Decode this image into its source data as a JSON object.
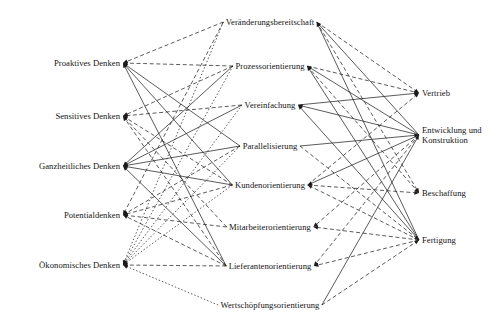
{
  "figure": {
    "type": "tripartite-directed-graph",
    "width": 503,
    "height": 330,
    "background_color": "#ffffff",
    "line_color": "#1a1a1a",
    "text_color": "#141414"
  },
  "columns": {
    "left": {
      "name": "Denkweisen",
      "x": 120,
      "nodes": [
        {
          "id": "L1",
          "label": "Proaktives Denken",
          "y": 63
        },
        {
          "id": "L2",
          "label": "Sensitives Denken",
          "y": 116
        },
        {
          "id": "L3",
          "label": "Ganzheitliches Denken",
          "y": 166
        },
        {
          "id": "L4",
          "label": "Potentialdenken",
          "y": 215
        },
        {
          "id": "L5",
          "label": "Ökonomisches Denken",
          "y": 265
        }
      ]
    },
    "middle": {
      "name": "Gestaltungsprinzipien",
      "x": 270,
      "nodes": [
        {
          "id": "M1",
          "label": "Veränderungsbereitschaft",
          "y": 22
        },
        {
          "id": "M2",
          "label": "Prozessorientierung",
          "y": 66
        },
        {
          "id": "M3",
          "label": "Vereinfachung",
          "y": 105
        },
        {
          "id": "M4",
          "label": "Parallelisierung",
          "y": 146
        },
        {
          "id": "M5",
          "label": "Kundenorientierung",
          "y": 185
        },
        {
          "id": "M6",
          "label": "Mitarbeiterorientierung",
          "y": 227
        },
        {
          "id": "M7",
          "label": "Lieferantenorientierung",
          "y": 266
        },
        {
          "id": "M8",
          "label": "Wertschöpfungsorientierung",
          "y": 305
        }
      ]
    },
    "right": {
      "name": "Unternehmensbereiche",
      "x": 422,
      "nodes": [
        {
          "id": "R1",
          "label": "Vertrieb",
          "y": 93,
          "lines": [
            "Vertrieb"
          ]
        },
        {
          "id": "R2",
          "label": "Entwicklung und Konstruktion",
          "y": 135,
          "lines": [
            "Entwicklung und",
            "Konstruktion"
          ]
        },
        {
          "id": "R3",
          "label": "Beschaffung",
          "y": 193,
          "lines": [
            "Beschaffung"
          ]
        },
        {
          "id": "R4",
          "label": "Fertigung",
          "y": 240,
          "lines": [
            "Fertigung"
          ]
        }
      ]
    }
  },
  "edges_mid_to_left": [
    {
      "from": "M1",
      "to": "L1",
      "style": "dashed"
    },
    {
      "from": "M2",
      "to": "L1",
      "style": "dashed"
    },
    {
      "from": "M4",
      "to": "L1",
      "style": "solid"
    },
    {
      "from": "M5",
      "to": "L1",
      "style": "solid"
    },
    {
      "from": "M7",
      "to": "L1",
      "style": "solid"
    },
    {
      "from": "M2",
      "to": "L2",
      "style": "dashed"
    },
    {
      "from": "M3",
      "to": "L2",
      "style": "dashed"
    },
    {
      "from": "M5",
      "to": "L2",
      "style": "dashed"
    },
    {
      "from": "M6",
      "to": "L2",
      "style": "dashed"
    },
    {
      "from": "M7",
      "to": "L2",
      "style": "dashed"
    },
    {
      "from": "M2",
      "to": "L3",
      "style": "solid"
    },
    {
      "from": "M3",
      "to": "L3",
      "style": "solid"
    },
    {
      "from": "M4",
      "to": "L3",
      "style": "solid"
    },
    {
      "from": "M5",
      "to": "L3",
      "style": "solid"
    },
    {
      "from": "M7",
      "to": "L3",
      "style": "solid"
    },
    {
      "from": "M1",
      "to": "L4",
      "style": "dashed"
    },
    {
      "from": "M4",
      "to": "L4",
      "style": "dashed"
    },
    {
      "from": "M5",
      "to": "L4",
      "style": "dashed"
    },
    {
      "from": "M6",
      "to": "L4",
      "style": "dashed"
    },
    {
      "from": "M7",
      "to": "L4",
      "style": "dashed"
    },
    {
      "from": "M1",
      "to": "L5",
      "style": "dotted"
    },
    {
      "from": "M2",
      "to": "L5",
      "style": "dotted"
    },
    {
      "from": "M3",
      "to": "L5",
      "style": "dotted"
    },
    {
      "from": "M4",
      "to": "L5",
      "style": "dotted"
    },
    {
      "from": "M5",
      "to": "L5",
      "style": "dotted"
    },
    {
      "from": "M7",
      "to": "L5",
      "style": "dashed"
    },
    {
      "from": "M8",
      "to": "L5",
      "style": "dotted"
    }
  ],
  "edges_mid_to_right": [
    {
      "from": "M1",
      "to": "R1",
      "style": "dashed"
    },
    {
      "from": "M1",
      "to": "R2",
      "style": "solid"
    },
    {
      "from": "M1",
      "to": "R3",
      "style": "dashed"
    },
    {
      "from": "M1",
      "to": "R4",
      "style": "solid"
    },
    {
      "from": "M2",
      "to": "R1",
      "style": "dashed"
    },
    {
      "from": "M2",
      "to": "R2",
      "style": "solid"
    },
    {
      "from": "M2",
      "to": "R3",
      "style": "dashed"
    },
    {
      "from": "M2",
      "to": "R4",
      "style": "solid"
    },
    {
      "from": "M3",
      "to": "R1",
      "style": "solid"
    },
    {
      "from": "M3",
      "to": "R2",
      "style": "solid"
    },
    {
      "from": "M3",
      "to": "R4",
      "style": "solid"
    },
    {
      "from": "M4",
      "to": "R2",
      "style": "solid"
    },
    {
      "from": "M4",
      "to": "R4",
      "style": "dashed"
    },
    {
      "from": "M5",
      "to": "R1",
      "style": "dashed"
    },
    {
      "from": "M5",
      "to": "R2",
      "style": "solid"
    },
    {
      "from": "M5",
      "to": "R3",
      "style": "dashed"
    },
    {
      "from": "M5",
      "to": "R4",
      "style": "dashed"
    },
    {
      "from": "M6",
      "to": "R2",
      "style": "dashed"
    },
    {
      "from": "M6",
      "to": "R4",
      "style": "dashed"
    },
    {
      "from": "M7",
      "to": "R2",
      "style": "dashed"
    },
    {
      "from": "M7",
      "to": "R4",
      "style": "dashed"
    },
    {
      "from": "M8",
      "to": "R2",
      "style": "solid"
    },
    {
      "from": "M8",
      "to": "R4",
      "style": "dashed"
    }
  ]
}
